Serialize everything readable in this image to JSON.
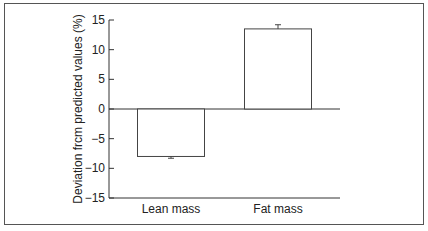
{
  "chart_data": {
    "type": "bar",
    "title": "",
    "xlabel": "",
    "ylabel": "Deviation frcm predicted values (%)",
    "categories": [
      "Lean mass",
      "Fat mass"
    ],
    "values": [
      -8,
      13.5
    ],
    "error": [
      0.3,
      0.7
    ],
    "ylim": [
      -15,
      15
    ],
    "yticks": [
      15,
      10,
      5,
      0,
      -5,
      -10,
      -15
    ],
    "grid": false,
    "legend": null
  }
}
